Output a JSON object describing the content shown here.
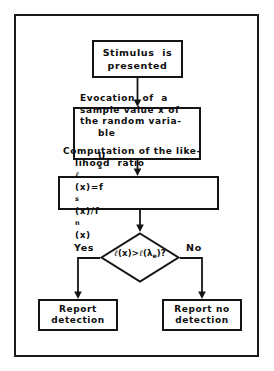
{
  "figure": {
    "type": "flowchart",
    "orientation": "top-to-bottom",
    "frame": "rectangular border enclosing diagram",
    "nodes": {
      "stimulus": {
        "shape": "rectangle",
        "line1": "Stimulus  is",
        "line2": "presented"
      },
      "evocation": {
        "shape": "rectangle",
        "line1": "Evocation  of  a",
        "line2": "sample value x of",
        "line3": "the random varia-",
        "line4": "ble",
        "line4_symbol": "U",
        "line4_subscript": "s"
      },
      "computation": {
        "shape": "rectangle",
        "line1": "Computation of the like-",
        "line2_prefix": "lihood  ratio  ",
        "line2_ell": "ℓ",
        "line2_mid": "(x)=f",
        "line2_sub1": "s",
        "line2_mid2": "(x)/f",
        "line2_sub2": "n",
        "line2_suffix": "(x)"
      },
      "decision": {
        "shape": "diamond",
        "ell": "ℓ",
        "expr_left": "(x)>",
        "expr_ell2": "ℓ",
        "expr_open": "(λ",
        "expr_sub": "e",
        "expr_close": ")?"
      },
      "report_detection": {
        "shape": "rectangle",
        "line1": "Report",
        "line2": "detection"
      },
      "report_no_detection": {
        "shape": "rectangle",
        "line1": "Report no",
        "line2": "detection"
      }
    },
    "branches": {
      "yes_label": "Yes",
      "no_label": "No"
    },
    "colors": {
      "stroke": "#141414",
      "text": "#0d0d0d",
      "background": "#ffffff"
    }
  }
}
